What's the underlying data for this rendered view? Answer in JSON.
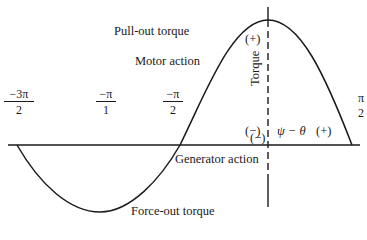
{
  "diagram": {
    "type": "torque-angle characteristic",
    "labels": {
      "pull_out": "Pull-out torque",
      "motor_action": "Motor action",
      "generator_action": "Generator action",
      "force_out": "Force-out torque",
      "vertical_axis": "Torque",
      "horizontal_axis": "ψ − θ"
    },
    "signs": {
      "top_plus": "(+)",
      "left_minus": "(−)",
      "right_plus": "(+)",
      "bottom_minus": "(−)"
    },
    "ticks": [
      {
        "num": "−3π",
        "den": "2"
      },
      {
        "num": "−π",
        "den": "1"
      },
      {
        "num": "−π",
        "den": "2"
      },
      {
        "num": "π",
        "den": "2"
      }
    ],
    "colors": {
      "ink": "#1a1a1a",
      "background": "#ffffff"
    }
  }
}
